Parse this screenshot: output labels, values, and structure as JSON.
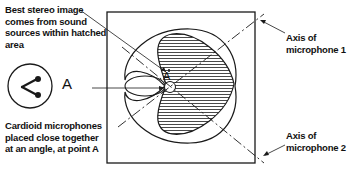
{
  "diagram": {
    "type": "stereo cardioid microphone pickup diagram",
    "labels": {
      "hatched_note": [
        "Best stereo image",
        "comes from sound",
        "sources within hatched",
        "area"
      ],
      "mic_note": [
        "Cardioid microphones",
        "placed close together",
        "at an angle, at point A"
      ],
      "axis1": [
        "Axis of",
        "microphone 1"
      ],
      "axis2": [
        "Axis of",
        "microphone 2"
      ],
      "point_a_inset": "A",
      "point_a_center": "A"
    },
    "colors": {
      "ink": "#1a1a1a",
      "background": "#ffffff"
    }
  }
}
